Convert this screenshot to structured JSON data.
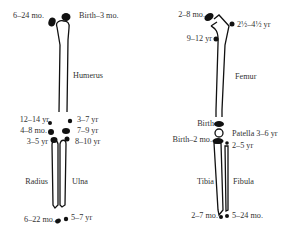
{
  "figure": {
    "arm": {
      "bones": {
        "humerus": "Humerus",
        "radius": "Radius",
        "ulna": "Ulna"
      },
      "labels": {
        "humerus_head_left": "6–24 mo.",
        "humerus_head_right": "Birth–3 mo.",
        "elbow_left_1": "12–14 yr",
        "elbow_left_2": "4–8 mo.",
        "elbow_left_3": "3–5 yr",
        "elbow_right_1": "3–7 yr",
        "elbow_right_2": "7–9 yr",
        "elbow_right_3": "8–10 yr",
        "wrist_left": "6–22 mo.",
        "wrist_right": "5–7 yr"
      }
    },
    "leg": {
      "bones": {
        "femur": "Femur",
        "tibia": "Tibia",
        "fibula": "Fibula"
      },
      "labels": {
        "femur_head": "2–8 mo.",
        "greater_trochanter": "2½–4½ yr",
        "lesser_trochanter": "9–12 yr",
        "distal_femur": "Birth",
        "proximal_tibia": "Birth–2 mo.",
        "patella": "Patella 3–6 yr",
        "proximal_fibula": "2–5 yr",
        "ankle_left": "2–7 mo.",
        "ankle_right": "5–24 mo."
      }
    },
    "colors": {
      "ink": "#111111",
      "text": "#333333",
      "background": "#ffffff"
    }
  }
}
